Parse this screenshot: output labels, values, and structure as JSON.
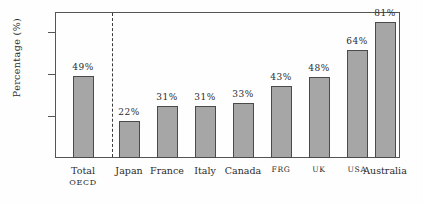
{
  "chart_data": {
    "type": "bar",
    "title": "",
    "xlabel": "",
    "ylabel": "Percentage (%)",
    "ylim": [
      0,
      87
    ],
    "grid": false,
    "legend": null,
    "yticks": [
      "0",
      "25%",
      "50%",
      "75%"
    ],
    "ytick_values": [
      0,
      25,
      50,
      75
    ],
    "categories": [
      "Total OECD",
      "Japan",
      "France",
      "Italy",
      "Canada",
      "FRG",
      "UK",
      "USA",
      "Australia"
    ],
    "values": [
      49,
      22,
      31,
      31,
      33,
      43,
      48,
      64,
      81
    ],
    "data_labels": [
      "49%",
      "22%",
      "31%",
      "31%",
      "33%",
      "43%",
      "48%",
      "64%",
      "81%"
    ],
    "annotations": [
      "dashed vertical divider separating Total OECD from individual countries"
    ]
  },
  "axis": {
    "y_title": "Percentage (%)",
    "ticks": [
      {
        "label": "75%",
        "value": 75
      },
      {
        "label": "50%",
        "value": 50
      },
      {
        "label": "25%",
        "value": 25
      },
      {
        "label": "0",
        "value": 0
      }
    ]
  },
  "bars": [
    {
      "name": "total-oecd",
      "label_line1": "Total",
      "label_line2": "OECD",
      "value": 49,
      "value_label": "49%",
      "smallcaps": false
    },
    {
      "name": "japan",
      "label_line1": "Japan",
      "label_line2": "",
      "value": 22,
      "value_label": "22%",
      "smallcaps": false
    },
    {
      "name": "france",
      "label_line1": "France",
      "label_line2": "",
      "value": 31,
      "value_label": "31%",
      "smallcaps": false
    },
    {
      "name": "italy",
      "label_line1": "Italy",
      "label_line2": "",
      "value": 31,
      "value_label": "31%",
      "smallcaps": false
    },
    {
      "name": "canada",
      "label_line1": "Canada",
      "label_line2": "",
      "value": 33,
      "value_label": "33%",
      "smallcaps": false
    },
    {
      "name": "frg",
      "label_line1": "FRG",
      "label_line2": "",
      "value": 43,
      "value_label": "43%",
      "smallcaps": true
    },
    {
      "name": "uk",
      "label_line1": "UK",
      "label_line2": "",
      "value": 48,
      "value_label": "48%",
      "smallcaps": true
    },
    {
      "name": "usa",
      "label_line1": "USA",
      "label_line2": "",
      "value": 64,
      "value_label": "64%",
      "smallcaps": true
    },
    {
      "name": "australia",
      "label_line1": "Australia",
      "label_line2": "",
      "value": 81,
      "value_label": "81%",
      "smallcaps": false
    }
  ],
  "colors": {
    "bar_fill": "#a6a6a6",
    "bar_edge": "#4a4a4a",
    "frame": "#555555",
    "text": "#2b2b2b",
    "background": "#fefefe"
  }
}
